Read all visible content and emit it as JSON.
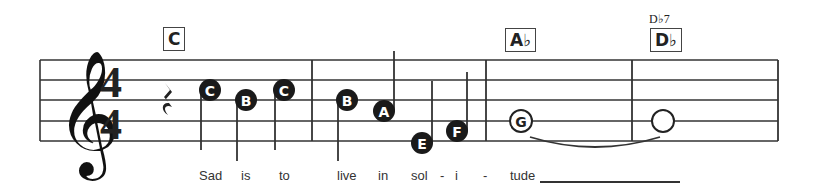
{
  "score": {
    "clef": "treble",
    "time_signature": {
      "top": "4",
      "bottom": "4"
    },
    "staff": {
      "x_start": 40,
      "x_end": 778,
      "lines_y": [
        60,
        80,
        100,
        121,
        141
      ],
      "color": "#333333"
    },
    "barlines_x": [
      312,
      486,
      632,
      778
    ],
    "rest": {
      "type": "quarter-rest",
      "x": 168
    },
    "chords": [
      {
        "label": "C",
        "x": 163,
        "y": 27
      },
      {
        "label": "A♭",
        "x": 505,
        "y": 28
      },
      {
        "label": "D♭",
        "x": 650,
        "y": 28,
        "above": "D♭7"
      }
    ],
    "notes": [
      {
        "letter": "C",
        "x": 210,
        "y": 90,
        "filled": true,
        "stem": "down",
        "stem_end": 150
      },
      {
        "letter": "B",
        "x": 246,
        "y": 100,
        "filled": true,
        "stem": "down",
        "stem_end": 161
      },
      {
        "letter": "C",
        "x": 284,
        "y": 90,
        "filled": true,
        "stem": "down",
        "stem_end": 150
      },
      {
        "letter": "B",
        "x": 347,
        "y": 100,
        "filled": true,
        "stem": "down",
        "stem_end": 161
      },
      {
        "letter": "A",
        "x": 384,
        "y": 111,
        "filled": true,
        "stem": "up",
        "stem_end": 51
      },
      {
        "letter": "E",
        "x": 422,
        "y": 143,
        "filled": true,
        "stem": "up",
        "stem_end": 81
      },
      {
        "letter": "F",
        "x": 457,
        "y": 131,
        "filled": true,
        "stem": "up",
        "stem_end": 72
      },
      {
        "letter": "G",
        "x": 521,
        "y": 121,
        "filled": false,
        "stem": "none"
      },
      {
        "letter": "",
        "x": 663,
        "y": 121,
        "filled": false,
        "stem": "none"
      }
    ],
    "tie": {
      "from_x": 530,
      "to_x": 660,
      "y": 137
    },
    "lyrics": [
      {
        "text": "Sad",
        "x": 199
      },
      {
        "text": "is",
        "x": 241
      },
      {
        "text": "to",
        "x": 279
      },
      {
        "text": "live",
        "x": 337
      },
      {
        "text": "in",
        "x": 378
      },
      {
        "text": "sol",
        "x": 411
      },
      {
        "text": "-",
        "x": 440
      },
      {
        "text": "i",
        "x": 455
      },
      {
        "text": "-",
        "x": 483
      },
      {
        "text": "tude",
        "x": 510
      }
    ],
    "lyric_extender": {
      "x_start": 540,
      "x_end": 680
    }
  }
}
